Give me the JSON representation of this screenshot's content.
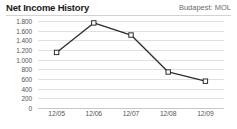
{
  "header": {
    "title": "Net Income History",
    "exchange_label": "Budapest: MOL"
  },
  "chart_data": {
    "type": "line",
    "title": "Net Income History",
    "subtitle": "Budapest: MOL",
    "xlabel": "",
    "ylabel": "",
    "categories": [
      "12/05",
      "12/06",
      "12/07",
      "12/08",
      "12/09"
    ],
    "values": [
      1150,
      1760,
      1510,
      745,
      555
    ],
    "series": [
      {
        "name": "Net Income",
        "values": [
          1150,
          1760,
          1510,
          745,
          555
        ]
      }
    ],
    "ylim": [
      0,
      1800
    ],
    "ytick_values": [
      0,
      200,
      400,
      600,
      800,
      1000,
      1200,
      1400,
      1600,
      1800
    ],
    "ytick_labels": [
      "0",
      "200",
      "400",
      "600",
      "800",
      "1.000",
      "1.200",
      "1.400",
      "1.600",
      "1.800"
    ],
    "xtick_labels": [
      "12/05",
      "12/06",
      "12/07",
      "12/08",
      "12/09"
    ],
    "grid": true,
    "legend": "none",
    "marker": "open-square",
    "line_color": "#2b2b2b",
    "grid_color": "#e0e0e0",
    "background_color": "#ffffff",
    "text_color": "#555555",
    "title_color": "#1a1a1a"
  }
}
